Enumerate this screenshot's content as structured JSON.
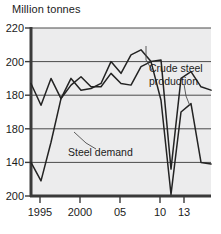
{
  "chart_data": {
    "type": "line",
    "title": "Million tonnes",
    "xlabel": "",
    "ylabel": "Million tonnes",
    "grid": true,
    "legend_position": "inline-annotations",
    "xlim": [
      1995,
      2013
    ],
    "ylim": [
      120,
      220
    ],
    "y_ticks": [
      {
        "value": 220,
        "label": "220"
      },
      {
        "value": 200,
        "label": "200"
      },
      {
        "value": 180,
        "label": "180"
      },
      {
        "value": 160,
        "label": "180"
      },
      {
        "value": 140,
        "label": "140"
      },
      {
        "value": 120,
        "label": "200"
      }
    ],
    "x_ticks": [
      {
        "value": 1995,
        "label": "1995"
      },
      {
        "value": 2000,
        "label": "2000"
      },
      {
        "value": 2005,
        "label": "05"
      },
      {
        "value": 2010,
        "label": "10"
      },
      {
        "value": 2013,
        "label": "13"
      }
    ],
    "x": [
      1995,
      1996,
      1997,
      1998,
      1999,
      2000,
      2001,
      2002,
      2003,
      2004,
      2005,
      2006,
      2007,
      2008,
      2009,
      2010,
      2011,
      2012,
      2013
    ],
    "series": [
      {
        "name": "Crude steel production",
        "annotation": "Crude steel production",
        "values": [
          187,
          174,
          190,
          178,
          190,
          183,
          184,
          187,
          200,
          193,
          204,
          207,
          200,
          201,
          136,
          190,
          194,
          185,
          183
        ]
      },
      {
        "name": "Steel demand",
        "annotation": "Steel demand",
        "values": [
          140,
          129,
          152,
          178,
          186,
          191,
          185,
          185,
          193,
          187,
          186,
          197,
          200,
          177,
          121,
          170,
          175,
          140,
          139
        ]
      }
    ],
    "annotations": [
      {
        "name": "crude-steel-production-label",
        "line1": "Crude steel",
        "line2": "production"
      },
      {
        "name": "steel-demand-label",
        "line1": "Steel demand",
        "line2": ""
      }
    ],
    "colors": {
      "plot_background": "#ececed",
      "series_line": "#232323",
      "gridline": "#4a4a4a",
      "axis": "#3a3a3a",
      "text": "#1b1b1b",
      "page_background": "#ffffff"
    }
  }
}
